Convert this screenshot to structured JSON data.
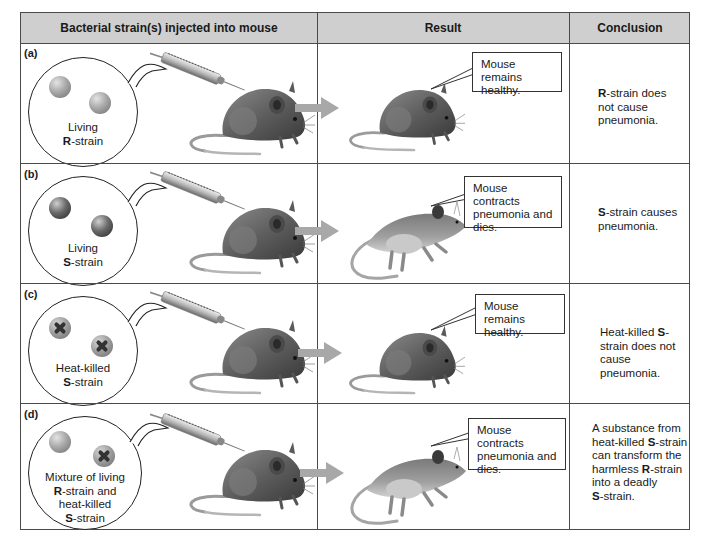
{
  "header": {
    "col1": "Bacterial strain(s) injected into mouse",
    "col2": "Result",
    "col3": "Conclusion"
  },
  "rows": [
    {
      "label": "(a)",
      "bacteria": [
        "living-R",
        "living-R"
      ],
      "injected_line1": "Living",
      "injected_bold": "R",
      "injected_line2_rest": "-strain",
      "result": "Mouse remains healthy.",
      "result_state": "healthy",
      "conclusion": [
        {
          "bold": "R",
          "text": "-strain does"
        },
        {
          "bold": "",
          "text": "not cause"
        },
        {
          "bold": "",
          "text": "pneumonia."
        }
      ]
    },
    {
      "label": "(b)",
      "bacteria": [
        "living-S",
        "living-S"
      ],
      "injected_line1": "Living",
      "injected_bold": "S",
      "injected_line2_rest": "-strain",
      "result": "Mouse contracts pneumonia and dies.",
      "result_state": "dead",
      "conclusion": [
        {
          "bold": "S",
          "text": "-strain causes"
        },
        {
          "bold": "",
          "text": "pneumonia."
        }
      ]
    },
    {
      "label": "(c)",
      "bacteria": [
        "heat-killed-S",
        "heat-killed-S"
      ],
      "injected_line1": "Heat-killed",
      "injected_bold": "S",
      "injected_line2_rest": "-strain",
      "result": "Mouse remains healthy.",
      "result_state": "healthy",
      "conclusion": [
        {
          "bold": "",
          "text": "Heat-killed ",
          "bold_after": "S",
          "after": "-"
        },
        {
          "bold": "",
          "text": "strain does not"
        },
        {
          "bold": "",
          "text": "cause pneumonia."
        }
      ]
    },
    {
      "label": "(d)",
      "bacteria": [
        "living-R",
        "heat-killed-S"
      ],
      "injected_line1": "Mixture of living",
      "injected_lines": [
        {
          "bold": "",
          "text": "Mixture of living"
        },
        {
          "bold": "R",
          "text": "-strain and"
        },
        {
          "bold": "",
          "text": "heat-killed"
        },
        {
          "bold": "S",
          "text": "-strain"
        }
      ],
      "result": "Mouse contracts pneumonia and dies.",
      "result_state": "dead",
      "conclusion": [
        {
          "bold": "",
          "text": "A substance from"
        },
        {
          "bold": "",
          "text": "heat-killed ",
          "bold_after": "S",
          "after": "-strain"
        },
        {
          "bold": "",
          "text": "can transform the"
        },
        {
          "bold": "",
          "text": "harmless ",
          "bold_after": "R",
          "after": "-strain"
        },
        {
          "bold": "",
          "text": "into a deadly"
        },
        {
          "bold": "S",
          "text": "-strain."
        }
      ]
    }
  ],
  "result_lines": {
    "healthy": [
      "Mouse remains",
      "healthy."
    ],
    "dead": [
      "Mouse contracts",
      "pneumonia and",
      "dies."
    ]
  },
  "colors": {
    "header_bg": "#cfcfcf",
    "border": "#4a4a4a",
    "arrow": "#a8a8a8"
  }
}
